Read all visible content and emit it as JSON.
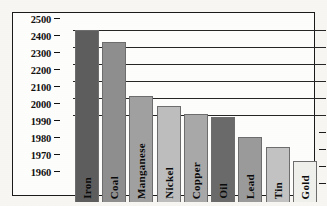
{
  "chart_data": {
    "type": "bar",
    "title": "",
    "xlabel": "",
    "ylabel": "",
    "categories": [
      "Iron",
      "Coal",
      "Manganese",
      "Nickel",
      "Copper",
      "Oil",
      "Lead",
      "Tin",
      "Gold"
    ],
    "values": [
      2500,
      2430,
      2110,
      2055,
      2005,
      1999,
      1987,
      1981,
      1973
    ],
    "axis_ticks": [
      2500,
      2400,
      2300,
      2200,
      2100,
      2000,
      1990,
      1980,
      1970,
      1960
    ],
    "axis_tick_labels": [
      "2500",
      "2400",
      "2300",
      "2200",
      "2100",
      "2000",
      "1990",
      "1980",
      "1970",
      "1960"
    ],
    "gridline_ticks": [
      2500,
      2400,
      2300,
      2200,
      2100,
      2000
    ],
    "right_edge_ticks": [
      1990,
      1980,
      1970,
      1960
    ],
    "ylim": [
      1955,
      2500
    ],
    "grid": true,
    "legend": false,
    "note": "y-axis uses a non-uniform (broken) scale: evenly spaced ticks from 2500 down to 2000 in steps of 100, then 1990, 1980, 1970, 1960 in steps of 10",
    "bar_colors": [
      "#5d5d5d",
      "#8e8e8e",
      "#a0a0a0",
      "#bdbdbd",
      "#a8a8a8",
      "#6a6a6a",
      "#9a9a9a",
      "#c2c2c2",
      "#efefec"
    ],
    "bar_order_note": "bars drawn left to right in descending height"
  },
  "axis": {
    "ticks": [
      {
        "label": "2500",
        "value": 2500,
        "pos": 1
      },
      {
        "label": "2400",
        "value": 2400,
        "pos": 2
      },
      {
        "label": "2300",
        "value": 2300,
        "pos": 3
      },
      {
        "label": "2200",
        "value": 2200,
        "pos": 4
      },
      {
        "label": "2100",
        "value": 2100,
        "pos": 5
      },
      {
        "label": "2000",
        "value": 2000,
        "pos": 6
      },
      {
        "label": "1990",
        "value": 1990,
        "pos": 7
      },
      {
        "label": "1980",
        "value": 1980,
        "pos": 8
      },
      {
        "label": "1970",
        "value": 1970,
        "pos": 9
      },
      {
        "label": "1960",
        "value": 1960,
        "pos": 10
      }
    ]
  },
  "bars": [
    {
      "label": "Iron",
      "value": 2500,
      "color": "#5d5d5d"
    },
    {
      "label": "Coal",
      "value": 2430,
      "color": "#8e8e8e"
    },
    {
      "label": "Manganese",
      "value": 2110,
      "color": "#a0a0a0"
    },
    {
      "label": "Nickel",
      "value": 2055,
      "color": "#bdbdbd"
    },
    {
      "label": "Copper",
      "value": 2005,
      "color": "#a8a8a8"
    },
    {
      "label": "Oil",
      "value": 1999,
      "color": "#6a6a6a"
    },
    {
      "label": "Lead",
      "value": 1987,
      "color": "#9a9a9a"
    },
    {
      "label": "Tin",
      "value": 1981,
      "color": "#c2c2c2"
    },
    {
      "label": "Gold",
      "value": 1973,
      "color": "#efefec"
    }
  ]
}
